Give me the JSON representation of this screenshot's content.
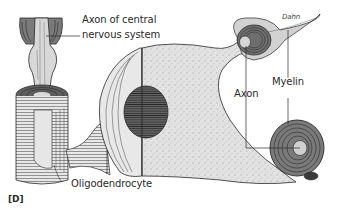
{
  "figure": {
    "panel_label": "[D]",
    "signature": "Dahn",
    "labels": {
      "axon_cns_line1": "Axon of central",
      "axon_cns_line2": "nervous system",
      "oligodendrocyte": "Oligodendrocyte",
      "axon": "Axon",
      "myelin": "Myelin"
    },
    "colors": {
      "ink": "#2a2a2a",
      "cytoplasm": "#dcdcdc",
      "myelin_dark": "#6e6e6e",
      "axon_fill": "#d6d6d6",
      "nucleus": "#5a5a5a",
      "background": "#ffffff"
    }
  }
}
